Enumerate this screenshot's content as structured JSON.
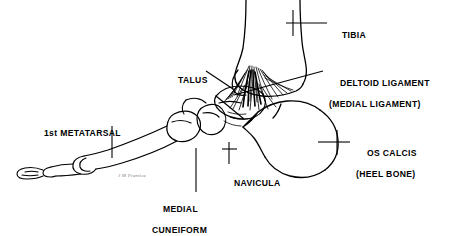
{
  "figure": {
    "background_color": "#ffffff",
    "ink_color": "#000000",
    "width": 451,
    "height": 235
  },
  "labels": {
    "tibia": {
      "line1": "TIBIA",
      "line2": ""
    },
    "deltoid_ligament": {
      "line1": "DELTOID LIGAMENT",
      "line2": "(MEDIAL LIGAMENT)"
    },
    "os_calcis": {
      "line1": "OS CALCIS",
      "line2": "(HEEL BONE)"
    },
    "talus": {
      "line1": "TALUS",
      "line2": ""
    },
    "first_metatarsal": {
      "line1": "1st METATARSAL",
      "line2": ""
    },
    "navicula": {
      "line1": "NAVICULA",
      "line2": ""
    },
    "medial_cuneiform": {
      "line1": "MEDIAL",
      "line2": "CUNEIFORM"
    }
  },
  "signature": {
    "text": "J M Prentice"
  }
}
